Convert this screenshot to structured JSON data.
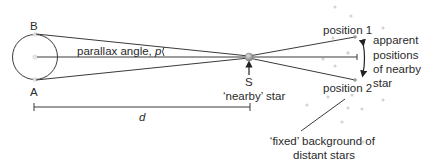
{
  "labels": {
    "point_b": "B",
    "point_a": "A",
    "parallax_text": "parallax angle, ",
    "parallax_symbol": "p",
    "star_letter": "S",
    "nearby_star": "‘nearby’ star",
    "position_1": "position 1",
    "position_2": "position 2",
    "apparent_line1": "apparent",
    "apparent_line2": "positions",
    "apparent_line3": "of nearby",
    "apparent_line4": "star",
    "distance": "d",
    "background_line1": "‘fixed’ background of",
    "background_line2": "distant stars"
  },
  "colors": {
    "line": "#3a3a3a",
    "star": "#9a9a9a",
    "bg_star": "#d0d0d0"
  }
}
